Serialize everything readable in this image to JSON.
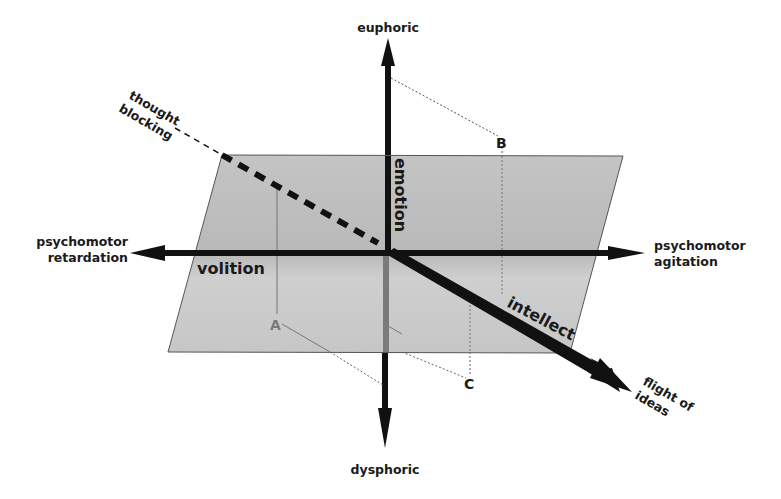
{
  "diagram": {
    "type": "3d-axes-with-plane",
    "colors": {
      "plane_fill": "#c8c8c8",
      "plane_stroke": "#555555",
      "axis": "#111111",
      "axis_below_plane": "#777777",
      "point_A": "#7a7a7a",
      "point_B": "#1a1a1a",
      "point_C": "#1a1a1a",
      "guide_line": "#666666"
    },
    "vertical_axis": {
      "name": "emotion",
      "top_label": "euphoric",
      "bottom_label": "dysphoric"
    },
    "horizontal_axis": {
      "name": "volition",
      "left_label_line1": "psychomotor",
      "left_label_line2": "retardation",
      "right_label_line1": "psychomotor",
      "right_label_line2": "agitation"
    },
    "depth_axis": {
      "name": "intellect",
      "back_label_line1": "thought",
      "back_label_line2": "blocking",
      "front_label_line1": "flight of",
      "front_label_line2": "ideas"
    },
    "points": [
      {
        "label": "A",
        "position": "below plane, left-front"
      },
      {
        "label": "B",
        "position": "above plane, right-back"
      },
      {
        "label": "C",
        "position": "below plane, right-front"
      }
    ]
  }
}
